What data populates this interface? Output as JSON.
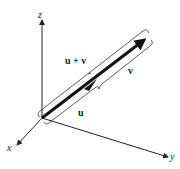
{
  "figure": {
    "type": "3d-vector-addition-diagram",
    "axes": {
      "x_label": "x",
      "y_label": "y",
      "z_label": "z"
    },
    "vectors": {
      "sum_label": "u + v",
      "u_label": "u",
      "v_label": "v"
    },
    "colors": {
      "ink": "#222222",
      "background": "#ffffff"
    }
  }
}
